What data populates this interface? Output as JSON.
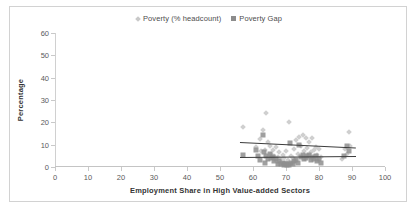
{
  "chart_data": {
    "type": "scatter",
    "title": "",
    "xlabel": "Employment Share in High Value-added Sectors",
    "ylabel": "Percentage",
    "xlim": [
      0,
      100
    ],
    "ylim": [
      0,
      60
    ],
    "xticks": [
      0,
      10,
      20,
      30,
      40,
      50,
      60,
      70,
      80,
      90,
      100
    ],
    "yticks": [
      0,
      10,
      20,
      30,
      40,
      50,
      60
    ],
    "grid": false,
    "legend_position": "top-center",
    "series": [
      {
        "name": "Poverty (% headcount)",
        "marker": "diamond",
        "color": "#cfcfcf",
        "points": [
          [
            57.0,
            18.0
          ],
          [
            61.0,
            9.0
          ],
          [
            62.0,
            12.5
          ],
          [
            62.5,
            7.0
          ],
          [
            63.0,
            16.5
          ],
          [
            63.5,
            7.5
          ],
          [
            64.0,
            24.3
          ],
          [
            64.5,
            11.0
          ],
          [
            65.0,
            9.5
          ],
          [
            65.5,
            6.0
          ],
          [
            66.0,
            7.8
          ],
          [
            66.5,
            5.0
          ],
          [
            67.0,
            9.0
          ],
          [
            67.5,
            4.5
          ],
          [
            68.0,
            6.5
          ],
          [
            68.5,
            3.5
          ],
          [
            69.0,
            5.5
          ],
          [
            69.5,
            4.0
          ],
          [
            70.0,
            7.0
          ],
          [
            70.5,
            3.0
          ],
          [
            71.0,
            20.3
          ],
          [
            71.5,
            5.0
          ],
          [
            72.0,
            4.0
          ],
          [
            72.5,
            8.0
          ],
          [
            73.0,
            12.0
          ],
          [
            73.5,
            6.0
          ],
          [
            74.0,
            13.5
          ],
          [
            74.5,
            9.5
          ],
          [
            75.0,
            14.5
          ],
          [
            75.5,
            7.0
          ],
          [
            76.0,
            13.2
          ],
          [
            76.5,
            8.5
          ],
          [
            77.0,
            11.0
          ],
          [
            77.5,
            6.5
          ],
          [
            78.0,
            13.0
          ],
          [
            78.5,
            7.5
          ],
          [
            79.0,
            9.0
          ],
          [
            79.5,
            5.5
          ],
          [
            80.0,
            8.0
          ],
          [
            80.5,
            4.5
          ],
          [
            87.0,
            3.5
          ],
          [
            88.0,
            8.0
          ],
          [
            88.5,
            6.0
          ],
          [
            89.0,
            15.5
          ],
          [
            89.5,
            9.5
          ]
        ]
      },
      {
        "name": "Poverty Gap",
        "marker": "square",
        "color": "#8f8f8f",
        "points": [
          [
            57.0,
            5.2
          ],
          [
            61.0,
            7.5
          ],
          [
            61.5,
            5.0
          ],
          [
            62.0,
            3.0
          ],
          [
            63.0,
            14.5
          ],
          [
            63.3,
            6.5
          ],
          [
            63.6,
            2.0
          ],
          [
            64.0,
            5.0
          ],
          [
            64.5,
            3.5
          ],
          [
            65.0,
            6.0
          ],
          [
            65.5,
            4.0
          ],
          [
            66.0,
            4.5
          ],
          [
            66.5,
            2.5
          ],
          [
            67.0,
            3.5
          ],
          [
            67.5,
            1.5
          ],
          [
            68.0,
            2.5
          ],
          [
            68.5,
            1.2
          ],
          [
            69.0,
            2.0
          ],
          [
            69.3,
            1.0
          ],
          [
            69.6,
            1.5
          ],
          [
            70.0,
            1.2
          ],
          [
            70.3,
            0.8
          ],
          [
            70.6,
            1.5
          ],
          [
            71.0,
            1.0
          ],
          [
            71.3,
            10.8
          ],
          [
            71.6,
            1.8
          ],
          [
            72.0,
            1.2
          ],
          [
            72.5,
            2.5
          ],
          [
            73.0,
            3.0
          ],
          [
            73.5,
            2.0
          ],
          [
            74.0,
            10.0
          ],
          [
            74.5,
            4.5
          ],
          [
            75.0,
            5.5
          ],
          [
            75.5,
            3.5
          ],
          [
            76.0,
            4.0
          ],
          [
            76.5,
            5.0
          ],
          [
            77.0,
            5.2
          ],
          [
            77.5,
            3.0
          ],
          [
            78.0,
            4.5
          ],
          [
            78.5,
            3.5
          ],
          [
            79.0,
            5.0
          ],
          [
            79.5,
            2.5
          ],
          [
            80.0,
            3.5
          ],
          [
            80.5,
            2.0
          ],
          [
            87.5,
            5.0
          ],
          [
            88.5,
            9.5
          ],
          [
            89.0,
            7.0
          ]
        ]
      }
    ],
    "trendlines": [
      {
        "name": "Poverty (% headcount) trend",
        "x0": 56.0,
        "y0": 11.2,
        "x1": 91.0,
        "y1": 8.7,
        "color": "#3c3c3c"
      },
      {
        "name": "Poverty Gap trend",
        "x0": 56.0,
        "y0": 4.7,
        "x1": 91.0,
        "y1": 5.2,
        "color": "#3c3c3c"
      }
    ]
  },
  "legend": {
    "items": [
      {
        "label": "Poverty (% headcount)",
        "marker": "diamond"
      },
      {
        "label": "Poverty Gap",
        "marker": "square"
      }
    ]
  },
  "axes": {
    "ylabel": "Percentage",
    "xlabel": "Employment Share in High Value-added Sectors",
    "ytick_labels": [
      "60",
      "50",
      "40",
      "30",
      "20",
      "10",
      "0"
    ],
    "xtick_labels": [
      "0",
      "10",
      "20",
      "30",
      "40",
      "50",
      "60",
      "70",
      "80",
      "90",
      "100"
    ]
  }
}
